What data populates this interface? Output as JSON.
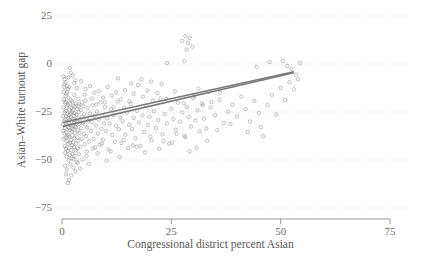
{
  "chart_data": {
    "type": "scatter",
    "title": "",
    "xlabel": "Congressional district percent Asian",
    "ylabel": "Asian–White turnout gap",
    "xlim": [
      -2,
      75
    ],
    "ylim": [
      -75,
      25
    ],
    "xticks": [
      0,
      25,
      50,
      75
    ],
    "xticklabels": [
      "0",
      "25",
      "50",
      "75"
    ],
    "yticks": [
      25,
      0,
      -25,
      -50,
      -75
    ],
    "yticklabels": [
      "25",
      "0",
      "−25",
      "−50",
      "−75"
    ],
    "grid": "horizontal-dotted",
    "legend": "none",
    "point_color": "#8c8c8c",
    "point_style": "open-circle",
    "line_color": "#7a7a7a",
    "grid_color": "#d9d9d9",
    "axis_color": "#9a9a9a",
    "fit_lines": [
      {
        "name": "fit-a",
        "x0": 0.2,
        "y0": -30.5,
        "x1": 53.0,
        "y1": -4.0
      },
      {
        "name": "fit-b",
        "x0": 0.2,
        "y0": -32.5,
        "x1": 53.0,
        "y1": -4.6
      }
    ],
    "points": [
      [
        0.2,
        -31.4
      ],
      [
        0.25,
        -27.2
      ],
      [
        0.3,
        -34.8
      ],
      [
        0.35,
        -22.6
      ],
      [
        0.4,
        -39.1
      ],
      [
        0.45,
        -18.4
      ],
      [
        0.5,
        -29.7
      ],
      [
        0.55,
        -36.2
      ],
      [
        0.6,
        -25.3
      ],
      [
        0.62,
        -42.8
      ],
      [
        0.65,
        -20.1
      ],
      [
        0.7,
        -33.5
      ],
      [
        0.72,
        -46.2
      ],
      [
        0.75,
        -28.9
      ],
      [
        0.8,
        -16.7
      ],
      [
        0.82,
        -38.4
      ],
      [
        0.85,
        -24.5
      ],
      [
        0.9,
        -44.1
      ],
      [
        0.92,
        -31.0
      ],
      [
        0.95,
        -19.8
      ],
      [
        1.0,
        -35.6
      ],
      [
        1.02,
        -27.4
      ],
      [
        1.05,
        -48.3
      ],
      [
        1.1,
        -22.1
      ],
      [
        1.12,
        -40.2
      ],
      [
        1.15,
        -30.3
      ],
      [
        1.2,
        -14.6
      ],
      [
        1.22,
        -37.8
      ],
      [
        1.25,
        -25.9
      ],
      [
        1.3,
        -45.4
      ],
      [
        1.32,
        -32.7
      ],
      [
        1.35,
        -21.3
      ],
      [
        1.4,
        -41.6
      ],
      [
        1.42,
        -28.2
      ],
      [
        1.45,
        -36.9
      ],
      [
        1.5,
        -17.5
      ],
      [
        1.52,
        -50.1
      ],
      [
        1.55,
        -26.6
      ],
      [
        1.6,
        -33.2
      ],
      [
        1.62,
        -43.7
      ],
      [
        1.65,
        -23.8
      ],
      [
        1.7,
        -38.0
      ],
      [
        1.72,
        -29.1
      ],
      [
        1.75,
        -47.5
      ],
      [
        1.8,
        -20.7
      ],
      [
        1.82,
        -34.4
      ],
      [
        1.85,
        -41.0
      ],
      [
        1.9,
        -26.0
      ],
      [
        1.92,
        -52.3
      ],
      [
        1.95,
        -31.7
      ],
      [
        2.0,
        -18.9
      ],
      [
        2.02,
        -39.6
      ],
      [
        2.05,
        -27.9
      ],
      [
        2.1,
        -44.8
      ],
      [
        2.12,
        -22.9
      ],
      [
        2.15,
        -35.1
      ],
      [
        2.2,
        -30.0
      ],
      [
        2.22,
        -49.2
      ],
      [
        2.25,
        -25.1
      ],
      [
        2.3,
        -42.3
      ],
      [
        2.32,
        -33.9
      ],
      [
        2.35,
        -19.4
      ],
      [
        2.4,
        -37.2
      ],
      [
        2.42,
        -28.6
      ],
      [
        2.45,
        -46.9
      ],
      [
        2.5,
        -24.2
      ],
      [
        2.52,
        -31.9
      ],
      [
        2.55,
        -40.8
      ],
      [
        2.6,
        -21.8
      ],
      [
        2.62,
        -54.0
      ],
      [
        2.65,
        -34.1
      ],
      [
        2.7,
        -27.0
      ],
      [
        2.72,
        -43.2
      ],
      [
        2.75,
        -30.8
      ],
      [
        2.8,
        -16.2
      ],
      [
        2.82,
        -38.7
      ],
      [
        2.85,
        -25.6
      ],
      [
        2.9,
        -48.0
      ],
      [
        2.92,
        -32.4
      ],
      [
        2.95,
        -22.3
      ],
      [
        3.0,
        -36.0
      ],
      [
        3.05,
        -29.3
      ],
      [
        3.1,
        -45.0
      ],
      [
        3.15,
        -20.4
      ],
      [
        3.2,
        -33.0
      ],
      [
        3.25,
        -41.4
      ],
      [
        3.3,
        -26.4
      ],
      [
        3.35,
        -51.0
      ],
      [
        3.4,
        -30.1
      ],
      [
        3.45,
        -23.4
      ],
      [
        3.5,
        -38.2
      ],
      [
        3.55,
        -28.0
      ],
      [
        3.6,
        -44.0
      ],
      [
        3.65,
        -34.6
      ],
      [
        3.7,
        -18.2
      ],
      [
        3.75,
        -40.0
      ],
      [
        3.8,
        -25.0
      ],
      [
        3.85,
        -47.0
      ],
      [
        3.9,
        -31.2
      ],
      [
        3.95,
        -21.0
      ],
      [
        4.0,
        -35.8
      ],
      [
        4.1,
        -28.8
      ],
      [
        4.2,
        -43.0
      ],
      [
        4.3,
        -24.0
      ],
      [
        4.4,
        -33.4
      ],
      [
        4.5,
        -39.0
      ],
      [
        4.6,
        -27.6
      ],
      [
        4.7,
        -49.8
      ],
      [
        4.8,
        -30.6
      ],
      [
        4.9,
        -22.0
      ],
      [
        5.0,
        -36.5
      ],
      [
        5.1,
        -26.2
      ],
      [
        5.2,
        -41.8
      ],
      [
        5.3,
        -31.5
      ],
      [
        5.4,
        -19.0
      ],
      [
        5.5,
        -37.5
      ],
      [
        5.6,
        -28.4
      ],
      [
        5.7,
        -45.6
      ],
      [
        5.8,
        -33.1
      ],
      [
        5.9,
        -23.0
      ],
      [
        6.0,
        -29.5
      ],
      [
        6.2,
        -40.4
      ],
      [
        6.4,
        -25.8
      ],
      [
        6.6,
        -34.9
      ],
      [
        6.8,
        -30.2
      ],
      [
        7.0,
        -21.5
      ],
      [
        7.2,
        -38.9
      ],
      [
        7.4,
        -27.1
      ],
      [
        7.6,
        -43.5
      ],
      [
        7.8,
        -32.0
      ],
      [
        8.0,
        -24.8
      ],
      [
        8.2,
        -36.3
      ],
      [
        8.4,
        -29.0
      ],
      [
        8.6,
        -42.0
      ],
      [
        8.8,
        -20.0
      ],
      [
        9.0,
        -33.7
      ],
      [
        9.2,
        -26.8
      ],
      [
        9.4,
        -39.4
      ],
      [
        9.6,
        -30.9
      ],
      [
        9.8,
        -22.5
      ],
      [
        10.0,
        -35.0
      ],
      [
        10.3,
        -28.3
      ],
      [
        10.6,
        -44.5
      ],
      [
        10.9,
        -31.1
      ],
      [
        11.2,
        -23.6
      ],
      [
        11.5,
        -37.0
      ],
      [
        11.8,
        -26.5
      ],
      [
        12.1,
        -40.6
      ],
      [
        12.4,
        -32.2
      ],
      [
        12.7,
        -19.6
      ],
      [
        13.0,
        -34.0
      ],
      [
        13.3,
        -27.8
      ],
      [
        13.6,
        -41.2
      ],
      [
        13.9,
        -29.8
      ],
      [
        14.2,
        -22.8
      ],
      [
        14.5,
        -36.8
      ],
      [
        14.8,
        -25.4
      ],
      [
        15.1,
        -43.8
      ],
      [
        15.4,
        -31.6
      ],
      [
        15.7,
        -20.8
      ],
      [
        16.0,
        -33.8
      ],
      [
        16.4,
        -28.1
      ],
      [
        16.8,
        -38.6
      ],
      [
        17.2,
        -24.4
      ],
      [
        17.6,
        -30.4
      ],
      [
        18.0,
        -42.6
      ],
      [
        18.4,
        -26.9
      ],
      [
        18.8,
        -35.4
      ],
      [
        19.2,
        -21.6
      ],
      [
        19.6,
        -31.8
      ],
      [
        20.0,
        -27.5
      ],
      [
        20.5,
        -39.8
      ],
      [
        21.0,
        -24.6
      ],
      [
        21.5,
        -33.3
      ],
      [
        22.0,
        -29.2
      ],
      [
        22.5,
        -18.0
      ],
      [
        23.0,
        -36.6
      ],
      [
        23.5,
        -26.1
      ],
      [
        24.0,
        -31.0
      ],
      [
        24.5,
        -41.5
      ],
      [
        25.0,
        -23.2
      ],
      [
        25.5,
        -28.7
      ],
      [
        26.0,
        -34.2
      ],
      [
        26.5,
        -20.2
      ],
      [
        27.0,
        -30.0
      ],
      [
        27.5,
        -25.2
      ],
      [
        28.0,
        -37.4
      ],
      [
        28.5,
        -22.4
      ],
      [
        29.0,
        -27.7
      ],
      [
        29.5,
        -32.6
      ],
      [
        30.0,
        -17.8
      ],
      [
        30.5,
        -29.4
      ],
      [
        31.0,
        -24.1
      ],
      [
        31.5,
        -35.2
      ],
      [
        32.0,
        -20.6
      ],
      [
        32.5,
        -28.5
      ],
      [
        33.0,
        -33.6
      ],
      [
        34.0,
        -22.7
      ],
      [
        35.0,
        -26.7
      ],
      [
        36.0,
        -18.6
      ],
      [
        37.0,
        -30.7
      ],
      [
        38.0,
        -24.9
      ],
      [
        39.0,
        -21.2
      ],
      [
        40.0,
        -27.3
      ],
      [
        41.0,
        -17.0
      ],
      [
        42.0,
        -23.5
      ],
      [
        43.0,
        -29.9
      ],
      [
        44.0,
        -19.2
      ],
      [
        45.0,
        -25.5
      ],
      [
        46.0,
        -37.6
      ],
      [
        47.0,
        -21.4
      ],
      [
        48.0,
        -16.0
      ],
      [
        49.0,
        -26.3
      ],
      [
        50.0,
        -12.5
      ],
      [
        51.0,
        -18.8
      ],
      [
        52.0,
        -9.5
      ],
      [
        53.0,
        -13.2
      ],
      [
        53.5,
        -5.5
      ],
      [
        54.0,
        -8.0
      ],
      [
        52.5,
        -2.5
      ],
      [
        51.5,
        -1.0
      ],
      [
        50.5,
        1.5
      ],
      [
        54.5,
        0.5
      ],
      [
        45.5,
        -33.0
      ],
      [
        42.5,
        -35.5
      ],
      [
        38.5,
        -31.3
      ],
      [
        35.5,
        -34.5
      ],
      [
        30.8,
        -43.6
      ],
      [
        28.2,
        -38.2
      ],
      [
        25.2,
        -41.0
      ],
      [
        22.2,
        -44.2
      ],
      [
        19.0,
        -46.0
      ],
      [
        16.2,
        -42.4
      ],
      [
        13.2,
        -48.5
      ],
      [
        10.2,
        -50.2
      ],
      [
        8.1,
        -46.5
      ],
      [
        6.1,
        -52.0
      ],
      [
        4.1,
        -54.5
      ],
      [
        3.1,
        -56.0
      ],
      [
        2.1,
        -58.0
      ],
      [
        1.6,
        -60.5
      ],
      [
        1.3,
        -62.0
      ],
      [
        1.1,
        -55.0
      ],
      [
        0.9,
        -57.5
      ],
      [
        0.7,
        -53.0
      ],
      [
        2.6,
        -49.5
      ],
      [
        3.6,
        -51.5
      ],
      [
        5.6,
        -48.0
      ],
      [
        7.1,
        -44.0
      ],
      [
        9.1,
        -41.5
      ],
      [
        11.1,
        -45.5
      ],
      [
        14.1,
        -39.5
      ],
      [
        17.1,
        -43.0
      ],
      [
        20.2,
        -37.8
      ],
      [
        23.2,
        -40.2
      ],
      [
        26.2,
        -36.4
      ],
      [
        29.2,
        -45.5
      ],
      [
        33.2,
        -40.0
      ],
      [
        27.5,
        12.0
      ],
      [
        28.2,
        14.5
      ],
      [
        28.8,
        11.0
      ],
      [
        29.2,
        13.5
      ],
      [
        29.8,
        9.0
      ],
      [
        28.5,
        7.5
      ],
      [
        28.0,
        1.5
      ],
      [
        24.0,
        0.5
      ],
      [
        47.5,
        1.0
      ],
      [
        44.5,
        -1.5
      ],
      [
        2.0,
        -4.5
      ],
      [
        2.4,
        -6.0
      ],
      [
        3.0,
        -8.5
      ],
      [
        1.8,
        -2.0
      ],
      [
        2.8,
        -10.0
      ],
      [
        3.4,
        -12.5
      ],
      [
        4.4,
        -9.0
      ],
      [
        5.4,
        -13.0
      ],
      [
        6.4,
        -11.5
      ],
      [
        7.4,
        -15.0
      ],
      [
        8.4,
        -14.0
      ],
      [
        9.4,
        -17.5
      ],
      [
        10.4,
        -12.0
      ],
      [
        11.4,
        -16.5
      ],
      [
        12.4,
        -14.8
      ],
      [
        13.4,
        -18.5
      ],
      [
        14.4,
        -13.5
      ],
      [
        15.4,
        -19.5
      ],
      [
        16.4,
        -15.5
      ],
      [
        17.4,
        -11.0
      ],
      [
        18.5,
        -17.0
      ],
      [
        19.5,
        -13.8
      ],
      [
        20.8,
        -19.0
      ],
      [
        21.8,
        -15.2
      ],
      [
        23.8,
        -18.2
      ],
      [
        25.8,
        -14.2
      ],
      [
        27.8,
        -20.5
      ],
      [
        30.2,
        -16.8
      ],
      [
        32.2,
        -21.5
      ],
      [
        34.2,
        -19.8
      ],
      [
        36.2,
        -15.0
      ],
      [
        31.2,
        -12.8
      ],
      [
        33.5,
        -14.5
      ],
      [
        22.8,
        -10.5
      ],
      [
        20.4,
        -9.2
      ],
      [
        18.2,
        -8.0
      ],
      [
        15.8,
        -10.2
      ],
      [
        12.8,
        -7.5
      ],
      [
        6.8,
        -18.0
      ],
      [
        5.2,
        -16.0
      ],
      [
        4.6,
        -20.0
      ],
      [
        3.8,
        -22.0
      ],
      [
        7.8,
        -21.0
      ],
      [
        9.8,
        -20.0
      ],
      [
        11.8,
        -22.5
      ],
      [
        0.5,
        -12.0
      ],
      [
        0.6,
        -8.0
      ],
      [
        0.45,
        -14.5
      ],
      [
        0.55,
        -10.5
      ],
      [
        0.38,
        -6.5
      ],
      [
        1.15,
        -11.5
      ],
      [
        1.35,
        -13.0
      ],
      [
        0.85,
        -9.5
      ],
      [
        0.95,
        -15.5
      ],
      [
        1.45,
        -7.0
      ],
      [
        1.65,
        -12.2
      ]
    ]
  },
  "axes": {
    "y_title": "Asian–White turnout gap",
    "x_title": "Congressional district percent Asian",
    "y_labels": [
      "25",
      "0",
      "−25",
      "−50",
      "−75"
    ],
    "x_labels": [
      "0",
      "25",
      "50",
      "75"
    ]
  }
}
